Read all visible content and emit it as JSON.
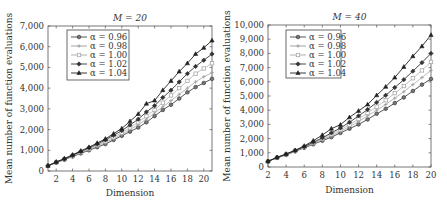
{
  "chart_data": [
    {
      "type": "line",
      "title": "M = 20",
      "xlabel": "Dimension",
      "ylabel": "Mean number of function evaluations",
      "xlim": [
        1,
        21
      ],
      "ylim": [
        0,
        7000
      ],
      "x_ticks": [
        2,
        4,
        6,
        8,
        10,
        12,
        14,
        16,
        18,
        20
      ],
      "y_ticks": [
        0,
        1000,
        2000,
        3000,
        4000,
        5000,
        6000,
        7000
      ],
      "y_tick_labels": [
        "0",
        "1,000",
        "2,000",
        "3,000",
        "4,000",
        "5,000",
        "6,000",
        "7,000"
      ],
      "legend_position": "upper left",
      "grid": false,
      "x": [
        1,
        2,
        3,
        4,
        5,
        6,
        7,
        8,
        9,
        10,
        11,
        12,
        13,
        14,
        15,
        16,
        17,
        18,
        19,
        20,
        21
      ],
      "series": [
        {
          "name": "α = 0.96",
          "marker": "circle",
          "values": [
            250,
            400,
            550,
            700,
            850,
            1000,
            1150,
            1300,
            1500,
            1700,
            1900,
            2100,
            2350,
            2650,
            2950,
            3200,
            3500,
            3800,
            4050,
            4250,
            4450
          ]
        },
        {
          "name": "α = 0.98",
          "marker": "plus",
          "values": [
            250,
            410,
            560,
            720,
            880,
            1040,
            1200,
            1370,
            1560,
            1770,
            2000,
            2230,
            2500,
            2800,
            3100,
            3400,
            3700,
            4000,
            4300,
            4550,
            4750
          ]
        },
        {
          "name": "α = 1.00",
          "marker": "square",
          "values": [
            250,
            420,
            570,
            740,
            910,
            1080,
            1250,
            1430,
            1630,
            1850,
            2100,
            2350,
            2650,
            2950,
            3300,
            3650,
            4000,
            4350,
            4700,
            4950,
            5200
          ]
        },
        {
          "name": "α = 1.02",
          "marker": "diamond",
          "values": [
            250,
            430,
            580,
            760,
            940,
            1120,
            1300,
            1500,
            1720,
            1950,
            2220,
            2500,
            2850,
            3150,
            3550,
            3900,
            4300,
            4700,
            5050,
            5350,
            5650
          ]
        },
        {
          "name": "α = 1.04",
          "marker": "triangle",
          "values": [
            250,
            440,
            600,
            780,
            970,
            1150,
            1350,
            1550,
            1800,
            2050,
            2400,
            2750,
            3250,
            3400,
            3900,
            4350,
            4800,
            5200,
            5650,
            5950,
            6300
          ]
        }
      ]
    },
    {
      "type": "line",
      "title": "M = 40",
      "xlabel": "Dimension",
      "ylabel": "Mean number of function evaluations",
      "xlim": [
        2,
        20
      ],
      "ylim": [
        0,
        10000
      ],
      "x_ticks": [
        2,
        4,
        6,
        8,
        10,
        12,
        14,
        16,
        18,
        20
      ],
      "y_ticks": [
        0,
        1000,
        2000,
        3000,
        4000,
        5000,
        6000,
        7000,
        8000,
        9000,
        10000
      ],
      "y_tick_labels": [
        "0",
        "1,000",
        "2,000",
        "3,000",
        "4,000",
        "5,000",
        "6,000",
        "7,000",
        "8,000",
        "9,000",
        "10,000"
      ],
      "legend_position": "upper left",
      "grid": false,
      "x": [
        2,
        3,
        4,
        5,
        6,
        7,
        8,
        9,
        10,
        11,
        12,
        13,
        14,
        15,
        16,
        17,
        18,
        19,
        20
      ],
      "series": [
        {
          "name": "α = 0.96",
          "marker": "circle",
          "values": [
            400,
            650,
            850,
            1100,
            1350,
            1600,
            1850,
            2100,
            2400,
            2700,
            3000,
            3350,
            3750,
            4100,
            4500,
            4900,
            5350,
            5800,
            6200
          ]
        },
        {
          "name": "α = 0.98",
          "marker": "plus",
          "values": [
            400,
            650,
            870,
            1120,
            1380,
            1650,
            1920,
            2200,
            2500,
            2850,
            3200,
            3600,
            4000,
            4400,
            4850,
            5300,
            5800,
            6300,
            6800
          ]
        },
        {
          "name": "α = 1.00",
          "marker": "square",
          "values": [
            400,
            660,
            880,
            1140,
            1400,
            1700,
            1980,
            2300,
            2620,
            2980,
            3380,
            3800,
            4250,
            4700,
            5200,
            5700,
            6250,
            6800,
            7400
          ]
        },
        {
          "name": "α = 1.02",
          "marker": "diamond",
          "values": [
            400,
            670,
            900,
            1160,
            1430,
            1750,
            2050,
            2400,
            2750,
            3150,
            3600,
            4050,
            4550,
            5050,
            5600,
            6150,
            6750,
            7350,
            8000
          ]
        },
        {
          "name": "α = 1.04",
          "marker": "triangle",
          "values": [
            400,
            680,
            920,
            1180,
            1480,
            1850,
            2250,
            2700,
            2980,
            3500,
            3950,
            4400,
            5050,
            5650,
            6300,
            7050,
            7800,
            8500,
            9300
          ]
        }
      ]
    }
  ],
  "charts": [
    {
      "title": "M = 20",
      "xlabel": "Dimension",
      "ylabel": "Mean number of function evaluations"
    },
    {
      "title": "M = 40",
      "xlabel": "Dimension",
      "ylabel": "Mean number of function evaluations"
    }
  ],
  "legend_labels": [
    "α = 0.96",
    "α = 0.98",
    "α = 1.00",
    "α = 1.02",
    "α = 1.04"
  ],
  "series_colors": [
    "#555555",
    "#999999",
    "#aaaaaa",
    "#333333",
    "#222222"
  ]
}
